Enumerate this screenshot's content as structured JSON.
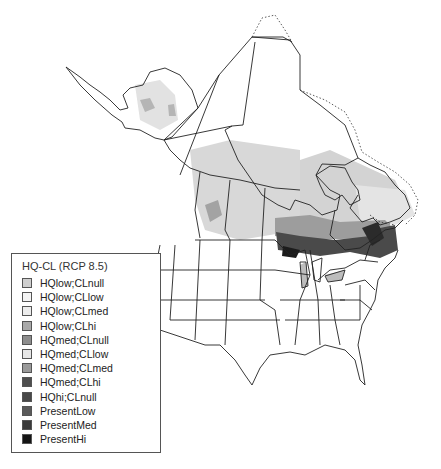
{
  "map": {
    "region": "North America (Canada and United States)",
    "colors": {
      "background": "#ffffff",
      "border": "#222222",
      "hqlow_clnull": "#cfcfcf",
      "hqlow_cllow": "#f4f4f4",
      "hqlow_clmed": "#ededed",
      "hqlow_clhi": "#a9a9a9",
      "hqmed_clnull": "#8d8d8d",
      "hqmed_cllow": "#e6e6e6",
      "hqmed_clmed": "#9a9a9a",
      "hqmed_clhi": "#4e4e4e",
      "hqhi_clnull": "#484848",
      "present_low": "#5a5a5a",
      "present_med": "#3a3a3a",
      "present_hi": "#151515"
    }
  },
  "legend": {
    "title": "HQ-CL (RCP 8.5)",
    "items": [
      {
        "label": "HQlow;CLnull",
        "color": "#cfcfcf"
      },
      {
        "label": "HQlow;CLlow",
        "color": "#f4f4f4"
      },
      {
        "label": "HQlow;CLmed",
        "color": "#ededed"
      },
      {
        "label": "HQlow;CLhi",
        "color": "#a9a9a9"
      },
      {
        "label": "HQmed;CLnull",
        "color": "#8d8d8d"
      },
      {
        "label": "HQmed;CLlow",
        "color": "#e6e6e6"
      },
      {
        "label": "HQmed;CLmed",
        "color": "#9a9a9a"
      },
      {
        "label": "HQmed;CLhi",
        "color": "#4e4e4e"
      },
      {
        "label": "HQhi;CLnull",
        "color": "#484848"
      },
      {
        "label": "PresentLow",
        "color": "#5a5a5a"
      },
      {
        "label": "PresentMed",
        "color": "#3a3a3a"
      },
      {
        "label": "PresentHi",
        "color": "#151515"
      }
    ]
  }
}
